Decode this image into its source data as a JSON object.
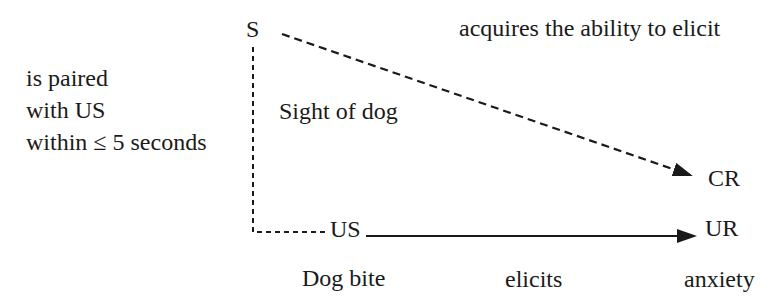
{
  "colors": {
    "background": "#ffffff",
    "ink": "#1a1a1a"
  },
  "diagram": {
    "cs": {
      "symbol": "S",
      "name": "Sight of dog"
    },
    "us": {
      "symbol": "US",
      "name": "Dog bite"
    },
    "cr": {
      "symbol": "CR"
    },
    "ur": {
      "symbol": "UR"
    },
    "pairing_note": {
      "line1": "is paired",
      "line2": "with US",
      "line3": "within ≤ 5 seconds"
    },
    "acquires_note": "acquires the ability to elicit",
    "elicits_label": "elicits",
    "response_name": "anxiety"
  }
}
